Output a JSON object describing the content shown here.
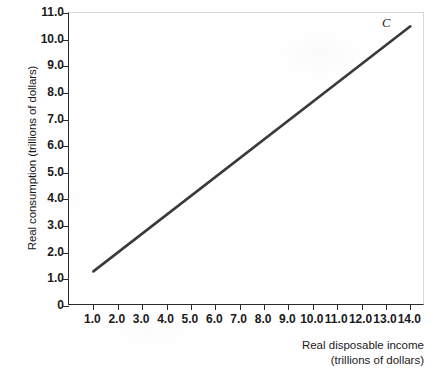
{
  "chart_data": {
    "type": "line",
    "title": "",
    "xlabel": "Real disposable income",
    "xlabel_line2": "(trillions of dollars)",
    "ylabel": "Real consumption (trillions of dollars)",
    "xlim": [
      0.0,
      14.6
    ],
    "ylim": [
      0.0,
      11.0
    ],
    "grid": false,
    "legend": "none",
    "xticks": [
      "1.0",
      "2.0",
      "3.0",
      "4.0",
      "5.0",
      "6.0",
      "7.0",
      "8.0",
      "9.0",
      "10.0",
      "11.0",
      "12.0",
      "13.0",
      "14.0"
    ],
    "xtick_values": [
      1.0,
      2.0,
      3.0,
      4.0,
      5.0,
      6.0,
      7.0,
      8.0,
      9.0,
      10.0,
      11.0,
      12.0,
      13.0,
      14.0
    ],
    "yticks": [
      "0",
      "1.0",
      "2.0",
      "3.0",
      "4.0",
      "5.0",
      "6.0",
      "7.0",
      "8.0",
      "9.0",
      "10.0",
      "11.0"
    ],
    "ytick_values": [
      0,
      1.0,
      2.0,
      3.0,
      4.0,
      5.0,
      6.0,
      7.0,
      8.0,
      9.0,
      10.0,
      11.0
    ],
    "series": [
      {
        "name": "C",
        "label": "C",
        "color": "#3a3a3a",
        "linewidth": 2.6,
        "x": [
          1.0,
          14.0
        ],
        "values": [
          1.3,
          10.5
        ],
        "annotation": {
          "text": "C",
          "x": 13.0,
          "y": 10.6,
          "style": "italic"
        }
      }
    ],
    "axis_color": "#2a2a2a",
    "frame_color": "#d8d8d8",
    "background": "#ffffff"
  }
}
